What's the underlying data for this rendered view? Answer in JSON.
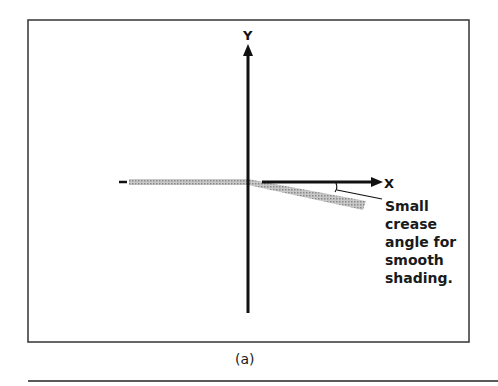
{
  "figure": {
    "axis_labels": {
      "y": "Y",
      "x": "X"
    },
    "annotation": {
      "lines": [
        "Small",
        "crease",
        "angle for",
        "smooth",
        "shading."
      ]
    },
    "caption": "(a)",
    "colors": {
      "axis": "#111111",
      "surface": "#b0b0b0",
      "frame": "#333333"
    }
  }
}
